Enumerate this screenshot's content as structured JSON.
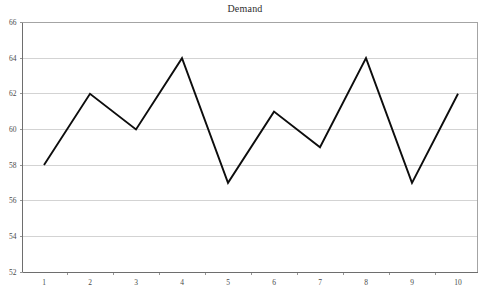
{
  "chart_data": {
    "type": "line",
    "title": "Demand",
    "xlabel": "",
    "ylabel": "",
    "categories": [
      "1",
      "2",
      "3",
      "4",
      "5",
      "6",
      "7",
      "8",
      "9",
      "10"
    ],
    "values": [
      58,
      62,
      60,
      64,
      57,
      61,
      59,
      64,
      57,
      62
    ],
    "series": [
      {
        "name": "Demand",
        "values": [
          58,
          62,
          60,
          64,
          57,
          61,
          59,
          64,
          57,
          62
        ]
      }
    ],
    "ylim": [
      52,
      66
    ],
    "ytick_step": 2,
    "ytick_labels": [
      "52",
      "54",
      "56",
      "58",
      "60",
      "62",
      "64",
      "66"
    ],
    "xtick_labels": [
      "1",
      "2",
      "3",
      "4",
      "5",
      "6",
      "7",
      "8",
      "9",
      "10"
    ],
    "grid": "horizontal",
    "legend": "none",
    "colors": {
      "line": "#0d0d0d",
      "grid": "#c8c8c8",
      "axis": "#6e6e6e",
      "border": "#9a9a9a",
      "background": "#ffffff",
      "text": "#4a4a4a"
    }
  }
}
